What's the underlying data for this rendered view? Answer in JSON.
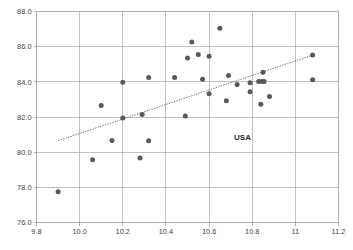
{
  "chart_data": {
    "type": "scatter",
    "title": "",
    "xlabel": "",
    "ylabel": "",
    "xlim": [
      9.8,
      11.2
    ],
    "ylim": [
      76.0,
      88.0
    ],
    "grid": true,
    "legend": "none",
    "xticks": [
      "9.8",
      "10.0",
      "10.2",
      "10.4",
      "10.6",
      "10.8",
      "11",
      "11.2"
    ],
    "xtick_values": [
      9.8,
      10.0,
      10.2,
      10.4,
      10.6,
      10.8,
      11.0,
      11.2
    ],
    "yticks": [
      "76.0",
      "78.0",
      "80.0",
      "82.0",
      "84.0",
      "86.0",
      "88.0"
    ],
    "ytick_values": [
      76.0,
      78.0,
      80.0,
      82.0,
      84.0,
      86.0,
      88.0
    ],
    "marker_color": "#595959",
    "grid_color": "#a6a6a6",
    "points": [
      {
        "x": 9.9,
        "y": 77.75
      },
      {
        "x": 10.06,
        "y": 79.57
      },
      {
        "x": 10.1,
        "y": 82.66
      },
      {
        "x": 10.15,
        "y": 80.66
      },
      {
        "x": 10.2,
        "y": 83.98
      },
      {
        "x": 10.2,
        "y": 81.95
      },
      {
        "x": 10.28,
        "y": 79.67
      },
      {
        "x": 10.29,
        "y": 82.14
      },
      {
        "x": 10.32,
        "y": 84.25
      },
      {
        "x": 10.32,
        "y": 80.65
      },
      {
        "x": 10.44,
        "y": 84.25
      },
      {
        "x": 10.49,
        "y": 82.05
      },
      {
        "x": 10.5,
        "y": 85.35
      },
      {
        "x": 10.52,
        "y": 86.27
      },
      {
        "x": 10.55,
        "y": 85.56
      },
      {
        "x": 10.57,
        "y": 84.15
      },
      {
        "x": 10.6,
        "y": 85.45
      },
      {
        "x": 10.6,
        "y": 83.32
      },
      {
        "x": 10.65,
        "y": 87.05
      },
      {
        "x": 10.69,
        "y": 84.36
      },
      {
        "x": 10.68,
        "y": 82.93
      },
      {
        "x": 10.73,
        "y": 83.85
      },
      {
        "x": 10.79,
        "y": 83.95
      },
      {
        "x": 10.79,
        "y": 83.44
      },
      {
        "x": 10.83,
        "y": 84.02
      },
      {
        "x": 10.845,
        "y": 84.02
      },
      {
        "x": 10.855,
        "y": 84.02
      },
      {
        "x": 10.84,
        "y": 82.73
      },
      {
        "x": 10.85,
        "y": 84.55
      },
      {
        "x": 10.88,
        "y": 83.16
      },
      {
        "x": 11.08,
        "y": 85.52
      },
      {
        "x": 11.08,
        "y": 84.12
      }
    ],
    "trendline": {
      "style": "dotted",
      "x1": 9.9,
      "y1": 80.65,
      "x2": 11.08,
      "y2": 85.52
    },
    "annotations": [
      {
        "label": "USA",
        "x": 10.755,
        "y": 80.7
      }
    ]
  }
}
